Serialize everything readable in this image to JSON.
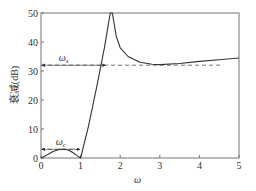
{
  "chart_data": {
    "type": "line",
    "title": "",
    "xlabel": "ω",
    "ylabel": "衰减(dB)",
    "xlim": [
      0,
      5
    ],
    "ylim": [
      0,
      50
    ],
    "xticks": [
      "0",
      "1",
      "2",
      "3",
      "4",
      "5"
    ],
    "yticks": [
      "0",
      "10",
      "20",
      "30",
      "40",
      "50"
    ],
    "grid": false,
    "legend": null,
    "series": [
      {
        "name": "attenuation",
        "x": [
          0,
          0.15,
          0.3,
          0.45,
          0.6,
          0.7,
          0.8,
          0.9,
          1.0,
          1.2,
          1.4,
          1.6,
          1.7,
          1.75,
          1.8,
          1.85,
          1.9,
          2.0,
          2.2,
          2.5,
          2.8,
          3.0,
          3.5,
          4.0,
          4.5,
          5.0
        ],
        "y": [
          0,
          1.0,
          2.2,
          2.9,
          3.0,
          2.7,
          1.9,
          0.9,
          0,
          11,
          24,
          38,
          46,
          50,
          50,
          46,
          42,
          38,
          35,
          33,
          32.3,
          32.2,
          32.6,
          33.3,
          33.9,
          34.5
        ]
      }
    ],
    "annotations": [
      {
        "label": "ωs",
        "type": "dashed-hline",
        "y": 32,
        "x_from": 0,
        "x_to": 4.6,
        "arrow_span": [
          0,
          1.65
        ]
      },
      {
        "label": "ωc",
        "type": "dashed-hline",
        "y": 3,
        "x_from": 0,
        "x_to": 1.0,
        "arrow_span": [
          0,
          1.0
        ]
      }
    ]
  },
  "labels": {
    "xlabel": "ω",
    "ylabel": "衰减(dB)",
    "omega_s": "ωs",
    "omega_c": "ωc"
  }
}
